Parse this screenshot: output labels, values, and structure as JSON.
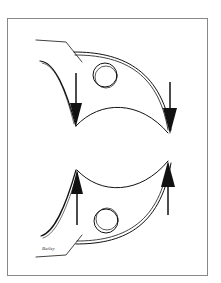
{
  "figure": {
    "panels": [
      {
        "name": "top",
        "arrow_direction": "down",
        "arrow_count": 2
      },
      {
        "name": "bottom",
        "arrow_direction": "up",
        "arrow_count": 2
      }
    ],
    "signature": "Bailey",
    "colors": {
      "line": "#111111",
      "frame": "#888888",
      "background": "#ffffff"
    }
  }
}
